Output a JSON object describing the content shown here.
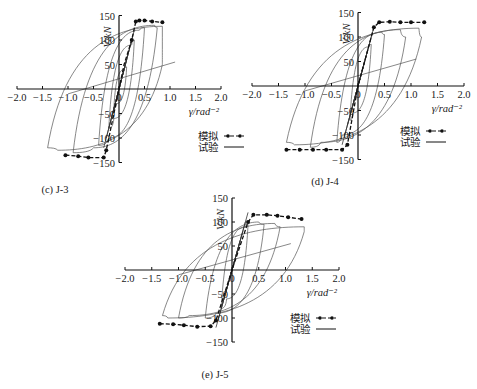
{
  "figure": {
    "panels": [
      {
        "id": "c",
        "caption": "(c) J-3"
      },
      {
        "id": "d",
        "caption": "(d) J-4"
      },
      {
        "id": "e",
        "caption": "(e) J-5"
      }
    ],
    "legend": {
      "simulation": "模拟",
      "test": "试验"
    },
    "xlabel": "γ/rad⁻²",
    "ylabel": "V/kN"
  },
  "chart_data": [
    {
      "type": "line",
      "title": "(c) J-3",
      "xlabel": "γ/rad-2",
      "ylabel": "V/kN",
      "xlim": [
        -2.0,
        2.0
      ],
      "ylim": [
        -150,
        150
      ],
      "xticks": [
        -2.0,
        -1.5,
        -1.0,
        -0.5,
        0,
        0.5,
        1.0,
        1.5,
        2.0
      ],
      "yticks": [
        -150,
        -100,
        -50,
        50,
        100,
        150
      ],
      "grid": false,
      "legend": [
        "模拟",
        "试验"
      ],
      "legend_position": "lower right",
      "series": [
        {
          "name": "模拟",
          "style": "dashed-markers",
          "x": [
            -1.05,
            -0.8,
            -0.6,
            -0.3,
            -0.25,
            -0.1,
            0,
            0.1,
            0.25,
            0.33,
            0.4,
            0.5,
            0.65,
            0.85
          ],
          "y": [
            -135,
            -137,
            -140,
            -140,
            -125,
            -50,
            0,
            50,
            100,
            138,
            140,
            140,
            138,
            136
          ]
        },
        {
          "name": "试验",
          "style": "solid",
          "loops": [
            {
              "x": [
                -0.1,
                0.1,
                0.15,
                -0.05,
                -0.1
              ],
              "y": [
                -40,
                40,
                45,
                -30,
                -40
              ]
            },
            {
              "x": [
                -0.2,
                0.25,
                0.3,
                -0.1,
                -0.2
              ],
              "y": [
                -80,
                90,
                100,
                -60,
                -80
              ]
            },
            {
              "x": [
                -0.4,
                0.4,
                0.5,
                -0.2,
                -0.4
              ],
              "y": [
                -115,
                120,
                125,
                -100,
                -115
              ]
            },
            {
              "x": [
                -0.9,
                0.7,
                0.75,
                -0.5,
                -0.9
              ],
              "y": [
                -130,
                130,
                125,
                -120,
                -130
              ]
            },
            {
              "x": [
                -1.4,
                0.85,
                0.85,
                -1.2,
                -1.4
              ],
              "y": [
                -120,
                128,
                50,
                -125,
                -120
              ]
            }
          ]
        }
      ]
    },
    {
      "type": "line",
      "title": "(d) J-4",
      "xlabel": "γ/rad-2",
      "ylabel": "V/kN",
      "xlim": [
        -2.0,
        2.0
      ],
      "ylim": [
        -150,
        150
      ],
      "xticks": [
        -2.0,
        -1.5,
        -1.0,
        -0.5,
        0,
        0.5,
        1.0,
        1.5,
        2.0
      ],
      "yticks": [
        -150,
        -100,
        -50,
        50,
        100,
        150
      ],
      "grid": false,
      "legend": [
        "模拟",
        "试验"
      ],
      "legend_position": "lower right",
      "series": [
        {
          "name": "模拟",
          "style": "dashed-markers",
          "x": [
            -1.35,
            -1.1,
            -0.85,
            -0.6,
            -0.3,
            -0.2,
            0,
            0.3,
            0.4,
            0.6,
            0.8,
            1.0,
            1.25
          ],
          "y": [
            -130,
            -130,
            -130,
            -130,
            -130,
            -120,
            0,
            120,
            130,
            131,
            130,
            130,
            130
          ]
        },
        {
          "name": "试验",
          "style": "solid",
          "loops": [
            {
              "x": [
                -0.15,
                0.2,
                0.25,
                -0.1,
                -0.15
              ],
              "y": [
                -70,
                80,
                85,
                -55,
                -70
              ]
            },
            {
              "x": [
                -0.4,
                0.45,
                0.5,
                -0.3,
                -0.4
              ],
              "y": [
                -115,
                110,
                105,
                -100,
                -115
              ]
            },
            {
              "x": [
                -0.9,
                0.8,
                0.9,
                -0.7,
                -0.9
              ],
              "y": [
                -125,
                115,
                100,
                -115,
                -125
              ]
            },
            {
              "x": [
                -1.35,
                1.15,
                1.2,
                -1.2,
                -1.35
              ],
              "y": [
                -115,
                118,
                100,
                -120,
                -115
              ]
            }
          ]
        }
      ]
    },
    {
      "type": "line",
      "title": "(e) J-5",
      "xlabel": "γ/rad-2",
      "ylabel": "V/kN",
      "xlim": [
        -2.0,
        2.0
      ],
      "ylim": [
        -150,
        150
      ],
      "xticks": [
        -2.0,
        -1.5,
        -1.0,
        -0.5,
        0,
        0.5,
        1.0,
        1.5,
        2.0
      ],
      "yticks": [
        -150,
        -100,
        -50,
        50,
        100,
        150
      ],
      "grid": false,
      "legend": [
        "模拟",
        "试验"
      ],
      "legend_position": "lower right",
      "series": [
        {
          "name": "模拟",
          "style": "dashed-markers",
          "x": [
            -1.35,
            -1.1,
            -0.9,
            -0.65,
            -0.4,
            -0.3,
            0,
            0.3,
            0.4,
            0.65,
            0.85,
            1.05,
            1.3
          ],
          "y": [
            -112,
            -113,
            -115,
            -118,
            -117,
            -105,
            0,
            100,
            115,
            115,
            113,
            110,
            106
          ]
        },
        {
          "name": "试验",
          "style": "solid",
          "loops": [
            {
              "x": [
                -0.2,
                0.25,
                0.3,
                -0.1,
                -0.2
              ],
              "y": [
                -80,
                90,
                95,
                -60,
                -80
              ]
            },
            {
              "x": [
                -0.5,
                0.5,
                0.6,
                -0.3,
                -0.5
              ],
              "y": [
                -100,
                100,
                95,
                -90,
                -100
              ]
            },
            {
              "x": [
                -1.0,
                0.8,
                0.9,
                -0.8,
                -1.0
              ],
              "y": [
                -100,
                97,
                90,
                -95,
                -100
              ]
            },
            {
              "x": [
                -1.3,
                1.35,
                1.35,
                -1.2,
                -1.3
              ],
              "y": [
                -95,
                90,
                80,
                -100,
                -95
              ]
            }
          ]
        }
      ]
    }
  ]
}
